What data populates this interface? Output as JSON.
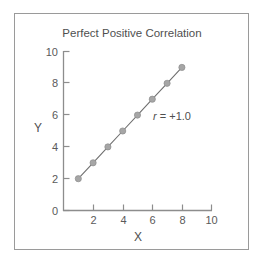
{
  "figure": {
    "border_color": "#9a9a9a",
    "background": "#ffffff"
  },
  "chart_data": {
    "type": "scatter",
    "title": "Perfect Positive Correlation",
    "xlabel": "X",
    "ylabel": "Y",
    "xlim": [
      0,
      10
    ],
    "ylim": [
      0,
      10
    ],
    "xticks": [
      2,
      4,
      6,
      8,
      10
    ],
    "yticks": [
      0,
      2,
      4,
      6,
      8,
      10
    ],
    "xtick_labels": [
      "2",
      "4",
      "6",
      "8",
      "10"
    ],
    "ytick_labels": [
      "0",
      "2",
      "4",
      "6",
      "8",
      "10"
    ],
    "grid": false,
    "legend": null,
    "line_connected": true,
    "marker_color": "#a6a6a6",
    "line_color": "#6f6f6f",
    "x": [
      1,
      2,
      3,
      4,
      5,
      6,
      7,
      8
    ],
    "y": [
      2,
      3,
      4,
      5,
      6,
      7,
      8,
      9
    ],
    "points": [
      {
        "x": 1,
        "y": 2
      },
      {
        "x": 2,
        "y": 3
      },
      {
        "x": 3,
        "y": 4
      },
      {
        "x": 4,
        "y": 5
      },
      {
        "x": 5,
        "y": 6
      },
      {
        "x": 6,
        "y": 7
      },
      {
        "x": 7,
        "y": 8
      },
      {
        "x": 8,
        "y": 9
      }
    ],
    "annotations": [
      {
        "symbol": "r",
        "text": " = +1.0",
        "full_text": "r = +1.0",
        "x": 7.3,
        "y": 5.7
      }
    ]
  }
}
